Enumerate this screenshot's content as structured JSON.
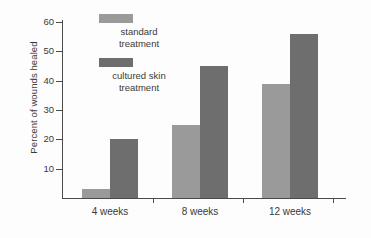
{
  "chart_data": {
    "type": "bar",
    "title": "",
    "xlabel": "",
    "ylabel": "Percent of wounds healed",
    "categories": [
      "4 weeks",
      "8 weeks",
      "12 weeks"
    ],
    "series": [
      {
        "name": "standard treatment",
        "values": [
          3,
          25,
          39
        ],
        "color": "#9a9a9a"
      },
      {
        "name": "cultured skin treatment",
        "values": [
          20,
          45,
          56
        ],
        "color": "#6e6e6e"
      }
    ],
    "ylim": [
      0,
      60
    ],
    "yticks": [
      10,
      20,
      30,
      40,
      50,
      60
    ],
    "ytick_labels": [
      "10",
      "20",
      "30",
      "40",
      "50",
      "60"
    ],
    "grid": false,
    "legend_position": "upper-left-inside",
    "background_color": "#fdfdfd",
    "axis_color": "#4a4a4a",
    "text_color": "#3a3a3a"
  },
  "legend": {
    "entries": [
      {
        "label_line1": "standard",
        "label_line2": "treatment",
        "swatch_color": "#9a9a9a"
      },
      {
        "label_line1": "cultured skin",
        "label_line2": "treatment",
        "swatch_color": "#6e6e6e"
      }
    ]
  },
  "axis": {
    "y_title": "Percent of wounds healed",
    "y_tick_labels": [
      "60",
      "50",
      "40",
      "30",
      "20",
      "10"
    ],
    "x_group_labels": [
      "4 weeks",
      "8 weeks",
      "12 weeks"
    ]
  }
}
